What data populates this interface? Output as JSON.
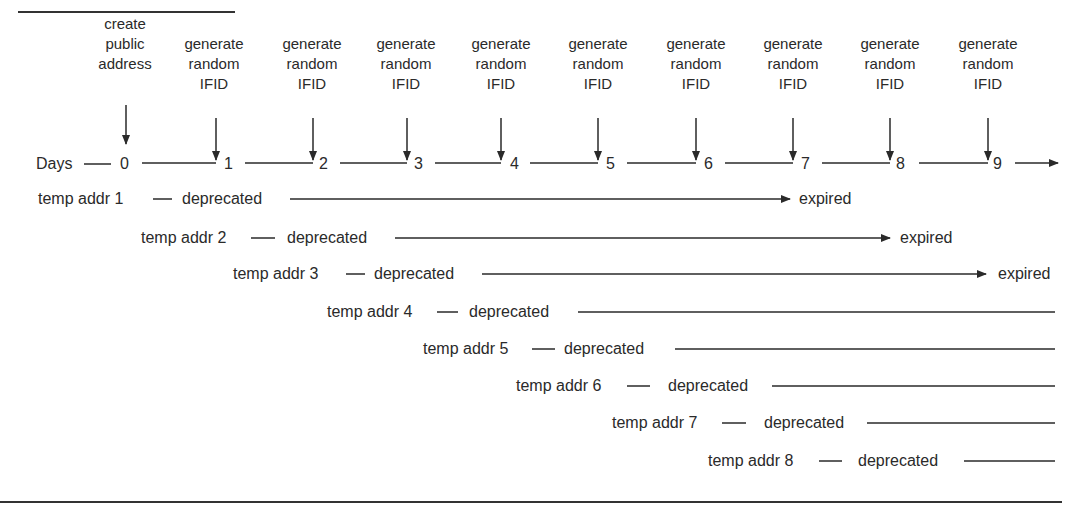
{
  "diagram": {
    "title_partial": "",
    "events": [
      {
        "label_lines": [
          "create",
          "public",
          "address"
        ],
        "day": "0"
      },
      {
        "label_lines": [
          "generate",
          "random",
          "IFID"
        ],
        "day": "1"
      },
      {
        "label_lines": [
          "generate",
          "random",
          "IFID"
        ],
        "day": "2"
      },
      {
        "label_lines": [
          "generate",
          "random",
          "IFID"
        ],
        "day": "3"
      },
      {
        "label_lines": [
          "generate",
          "random",
          "IFID"
        ],
        "day": "4"
      },
      {
        "label_lines": [
          "generate",
          "random",
          "IFID"
        ],
        "day": "5"
      },
      {
        "label_lines": [
          "generate",
          "random",
          "IFID"
        ],
        "day": "6"
      },
      {
        "label_lines": [
          "generate",
          "random",
          "IFID"
        ],
        "day": "7"
      },
      {
        "label_lines": [
          "generate",
          "random",
          "IFID"
        ],
        "day": "8"
      },
      {
        "label_lines": [
          "generate",
          "random",
          "IFID"
        ],
        "day": "9"
      }
    ],
    "axis_label": "Days",
    "rows": [
      {
        "name": "temp addr 1",
        "state": "deprecated",
        "end": "expired"
      },
      {
        "name": "temp addr 2",
        "state": "deprecated",
        "end": "expired"
      },
      {
        "name": "temp addr 3",
        "state": "deprecated",
        "end": "expired"
      },
      {
        "name": "temp addr 4",
        "state": "deprecated",
        "end": ""
      },
      {
        "name": "temp addr 5",
        "state": "deprecated",
        "end": ""
      },
      {
        "name": "temp addr 6",
        "state": "deprecated",
        "end": ""
      },
      {
        "name": "temp addr 7",
        "state": "deprecated",
        "end": ""
      },
      {
        "name": "temp addr 8",
        "state": "deprecated",
        "end": ""
      }
    ],
    "colors": {
      "ink": "#2a2a2a",
      "background": "#ffffff"
    }
  }
}
